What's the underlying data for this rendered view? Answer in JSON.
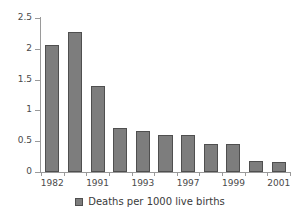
{
  "chart_data": {
    "type": "bar",
    "title": "",
    "subtitle": "",
    "xlabel": "",
    "ylabel": "",
    "grid": false,
    "legend_position": "bottom",
    "ylim": [
      0,
      2.5
    ],
    "ytick_labels": [
      "0",
      "0.5",
      "1",
      "1.5",
      "2",
      "2.5"
    ],
    "ytick_values": [
      0,
      0.5,
      1,
      1.5,
      2,
      2.5
    ],
    "categories": [
      "1982",
      "",
      "1991",
      "",
      "1993",
      "",
      "1997",
      "",
      "1999",
      "",
      "2001"
    ],
    "xtick_labels_visible": [
      "1982",
      "1991",
      "1993",
      "1997",
      "1999",
      "2001"
    ],
    "series": [
      {
        "name": "Deaths per 1000 live births",
        "color": "#7d7d7d",
        "edge_color": "#4f4f4f",
        "values": [
          2.07,
          2.28,
          1.4,
          0.72,
          0.66,
          0.6,
          0.6,
          0.45,
          0.45,
          0.18,
          0.17
        ]
      }
    ]
  },
  "legend": {
    "entries": [
      {
        "label": "Deaths per 1000 live births",
        "color": "#7d7d7d"
      }
    ]
  },
  "axis": {
    "line_color": "#9a9a9a"
  }
}
